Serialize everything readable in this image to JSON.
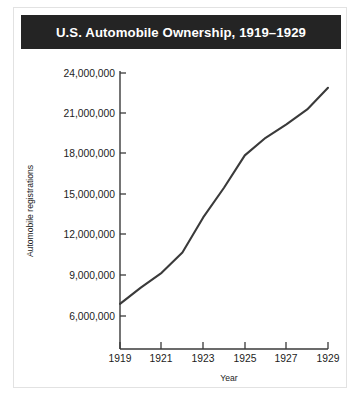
{
  "figure": {
    "title": "U.S. Automobile Ownership, 1919–1929",
    "title_bar_color": "#242424",
    "title_text_color": "#ffffff",
    "background_color": "#ffffff",
    "border_color": "#e2e2e2"
  },
  "chart_data": {
    "type": "line",
    "title": "U.S. Automobile Ownership, 1919–1929",
    "xlabel": "Year",
    "ylabel": "Automobile registrations",
    "x": [
      1919,
      1920,
      1921,
      1922,
      1923,
      1924,
      1925,
      1926,
      1927,
      1928,
      1929
    ],
    "values": [
      6900000,
      8100000,
      9200000,
      10700000,
      13300000,
      15500000,
      17900000,
      19200000,
      20200000,
      21300000,
      22900000
    ],
    "series": [
      {
        "name": "Automobile registrations",
        "color": "#3a3a3a",
        "values": [
          6900000,
          8100000,
          9200000,
          10700000,
          13300000,
          15500000,
          17900000,
          19200000,
          20200000,
          21300000,
          22900000
        ]
      }
    ],
    "xlim": [
      1919,
      1929
    ],
    "ylim": [
      4800000,
      24000000
    ],
    "x_tick_labels": [
      "1919",
      "1921",
      "1923",
      "1925",
      "1927",
      "1929"
    ],
    "x_tick_values": [
      1919,
      1921,
      1923,
      1925,
      1927,
      1929
    ],
    "y_tick_labels": [
      "24,000,000",
      "21,000,000",
      "18,000,000",
      "15,000,000",
      "12,000,000",
      "9,000,000",
      "6,000,000"
    ],
    "y_tick_values": [
      24000000,
      21000000,
      18000000,
      15000000,
      12000000,
      9000000,
      6000000
    ],
    "grid": false,
    "legend": null,
    "line_color": "#3a3a3a",
    "axis_color": "#3a3a3a",
    "markers": false
  }
}
